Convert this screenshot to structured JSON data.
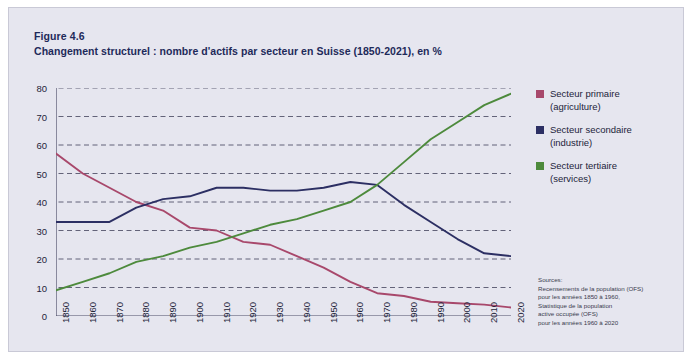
{
  "figure": {
    "label": "Figure 4.6",
    "title": "Changement structurel : nombre d'actifs par secteur en Suisse (1850-2021), en %"
  },
  "colors": {
    "primary": "#a8486b",
    "secondary": "#2c2f63",
    "tertiary": "#4d8a3c",
    "panel_bg": "#e6e6ef",
    "axis": "#4a4a66",
    "grid": "#3b3b55",
    "text": "#23243a",
    "title": "#1e2a5a"
  },
  "legend": {
    "position": "right",
    "items": [
      {
        "label_line1": "Secteur primaire",
        "label_line2": "(agriculture)",
        "color": "#a8486b",
        "swatch": "square-swatch"
      },
      {
        "label_line1": "Secteur secondaire",
        "label_line2": "(industrie)",
        "color": "#2c2f63",
        "swatch": "square-swatch"
      },
      {
        "label_line1": "Secteur tertiaire",
        "label_line2": "(services)",
        "color": "#4d8a3c",
        "swatch": "square-swatch"
      }
    ]
  },
  "sources": {
    "lines": [
      "Sources:",
      "Recensements de la population (OFS)",
      "pour les années 1850 à 1960,",
      "Statistique de la population",
      "active occupée (OFS)",
      "pour les années 1960 à 2020"
    ]
  },
  "chart_data": {
    "type": "line",
    "title": "Changement structurel : nombre d'actifs par secteur en Suisse (1850-2021), en %",
    "xlabel": "",
    "ylabel": "",
    "xlim": [
      1850,
      2020
    ],
    "ylim": [
      0,
      80
    ],
    "grid": true,
    "grid_style": "dashed-horizontal",
    "legend_position": "right",
    "ytick_labels": [
      "0",
      "10",
      "20",
      "30",
      "40",
      "50",
      "60",
      "70",
      "80"
    ],
    "yticks": [
      0,
      10,
      20,
      30,
      40,
      50,
      60,
      70,
      80
    ],
    "categories": [
      1850,
      1860,
      1870,
      1880,
      1890,
      1900,
      1910,
      1920,
      1930,
      1940,
      1950,
      1960,
      1970,
      1980,
      1990,
      2000,
      2010,
      2020
    ],
    "xtick_labels": [
      "1850",
      "1860",
      "1870",
      "1880",
      "1890",
      "1900",
      "1910",
      "1920",
      "1930",
      "1940",
      "1950",
      "1960",
      "1970",
      "1980",
      "1990",
      "2000",
      "2010",
      "2020"
    ],
    "series": [
      {
        "name": "Secteur primaire (agriculture)",
        "color": "#a8486b",
        "values": [
          57,
          50,
          45,
          40,
          37,
          31,
          30,
          26,
          25,
          21,
          17,
          12,
          8,
          7,
          5,
          4.5,
          4,
          3
        ]
      },
      {
        "name": "Secteur secondaire (industrie)",
        "color": "#2c2f63",
        "values": [
          33,
          33,
          33,
          38,
          41,
          42,
          45,
          45,
          44,
          44,
          45,
          47,
          46,
          39,
          33,
          27,
          22,
          21
        ]
      },
      {
        "name": "Secteur tertiaire (services)",
        "color": "#4d8a3c",
        "values": [
          9,
          12,
          15,
          19,
          21,
          24,
          26,
          29,
          32,
          34,
          37,
          40,
          46,
          54,
          62,
          68,
          74,
          78
        ]
      }
    ]
  }
}
